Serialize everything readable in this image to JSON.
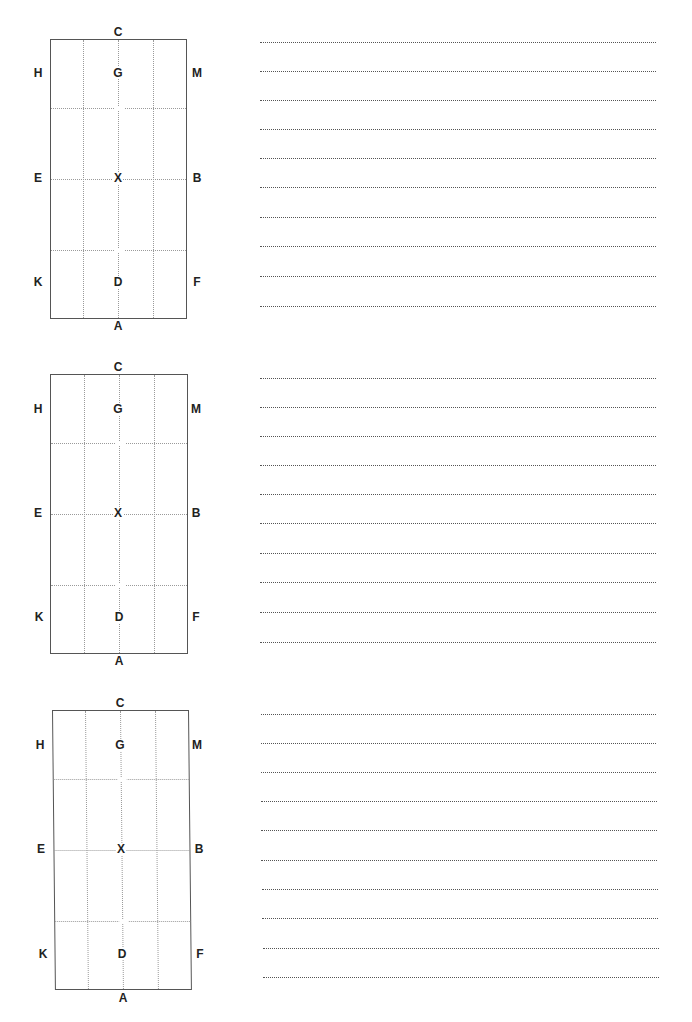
{
  "worksheet": {
    "blocks": [
      {
        "labels": {
          "top": "C",
          "bottom": "A",
          "top_left": "H",
          "top_center": "G",
          "top_right": "M",
          "mid_left": "E",
          "center": "X",
          "mid_right": "B",
          "bottom_left": "K",
          "bottom_center": "D",
          "bottom_right": "F"
        },
        "writing_lines": 10
      },
      {
        "labels": {
          "top": "C",
          "bottom": "A",
          "top_left": "H",
          "top_center": "G",
          "top_right": "M",
          "mid_left": "E",
          "center": "X",
          "mid_right": "B",
          "bottom_left": "K",
          "bottom_center": "D",
          "bottom_right": "F"
        },
        "writing_lines": 10
      },
      {
        "labels": {
          "top": "C",
          "bottom": "A",
          "top_left": "H",
          "top_center": "G",
          "top_right": "M",
          "mid_left": "E",
          "center": "X",
          "mid_right": "B",
          "bottom_left": "K",
          "bottom_center": "D",
          "bottom_right": "F"
        },
        "writing_lines": 10
      }
    ]
  },
  "colors": {
    "border": "#555555",
    "grid_dots": "#9a9a9a",
    "line_dots": "#555555",
    "text": "#222222"
  }
}
